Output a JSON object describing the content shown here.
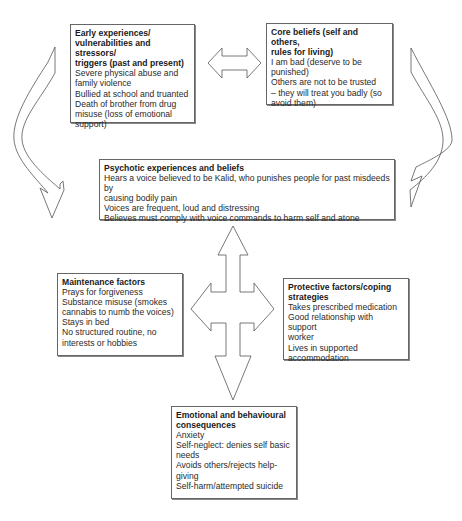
{
  "diagram": {
    "type": "cognitive-behavioural formulation",
    "boxes": [
      {
        "id": "early-experiences",
        "title": "Early experiences/ vulnerabilities and stressors/ triggers (past and present)",
        "title_lines": [
          "Early experiences/",
          "vulnerabilities and stressors/",
          "triggers (past and present)"
        ],
        "items": [
          "Severe physical abuse and",
          "family violence",
          "Bullied at school and truanted",
          "Death of brother from drug",
          "misuse (loss of emotional",
          "support)"
        ]
      },
      {
        "id": "core-beliefs",
        "title_lines": [
          "Core beliefs (self and others,",
          "rules for living)"
        ],
        "items": [
          "I am bad (deserve to be",
          "punished)",
          "Others are not to be trusted",
          "– they will treat you badly (so",
          "avoid them)"
        ]
      },
      {
        "id": "psychotic-experiences",
        "title_lines": [
          "Psychotic experiences and beliefs"
        ],
        "items": [
          "Hears a voice believed to be Kalid, who punishes people for past misdeeds by",
          "causing bodily pain",
          "Voices are frequent, loud and distressing",
          "Believes must comply with voice commands to harm self and atone"
        ]
      },
      {
        "id": "maintenance-factors",
        "title_lines": [
          "Maintenance factors"
        ],
        "items": [
          "Prays for forgiveness",
          "Substance misuse (smokes",
          "cannabis to numb the voices)",
          "Stays in bed",
          "No structured routine, no",
          "interests or hobbies"
        ]
      },
      {
        "id": "protective-factors",
        "title_lines": [
          "Protective factors/coping",
          "strategies"
        ],
        "items": [
          "Takes prescribed medication",
          "Good relationship with support",
          "worker",
          "Lives in supported",
          "accommodation"
        ]
      },
      {
        "id": "emotional-consequences",
        "title_lines": [
          "Emotional and behavioural",
          "consequences"
        ],
        "items": [
          "Anxiety",
          "Self-neglect: denies self basic",
          "needs",
          "Avoids others/rejects help-",
          "giving",
          "Self-harm/attempted suicide"
        ]
      }
    ],
    "connectors": [
      {
        "from": "early-experiences",
        "to": "core-beliefs",
        "style": "double-headed horizontal block arrow"
      },
      {
        "from": "early-experiences",
        "to": "psychotic-experiences",
        "style": "curved block arrow (left)"
      },
      {
        "from": "core-beliefs",
        "to": "psychotic-experiences",
        "style": "curved block arrow (right)"
      },
      {
        "from": "psychotic-experiences",
        "to": [
          "maintenance-factors",
          "protective-factors",
          "emotional-consequences"
        ],
        "style": "four-way cross block arrow"
      }
    ]
  }
}
